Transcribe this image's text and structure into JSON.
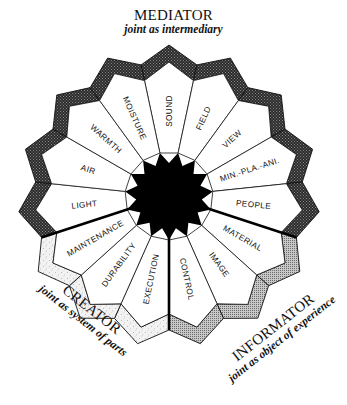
{
  "diagram": {
    "center": [
      169,
      196
    ],
    "segment_count": 15,
    "start_angle_deg": -102,
    "radii": {
      "star_outer": 44,
      "star_inner": 33,
      "band_inner_valley": 118,
      "band_inner_peak": 134,
      "band_outer_valley": 134,
      "band_outer_peak": 151
    },
    "segments": [
      {
        "label": "SOUND",
        "zone": "mediator"
      },
      {
        "label": "FIELD",
        "zone": "mediator"
      },
      {
        "label": "VIEW",
        "zone": "mediator"
      },
      {
        "label": "MIN.-PLA.-ANI.",
        "zone": "mediator"
      },
      {
        "label": "PEOPLE",
        "zone": "mediator"
      },
      {
        "label": "MATERIAL",
        "zone": "informator"
      },
      {
        "label": "IMAGE",
        "zone": "informator"
      },
      {
        "label": "CONTROL",
        "zone": "informator"
      },
      {
        "label": "EXECUTION",
        "zone": "creator"
      },
      {
        "label": "DURABILITY",
        "zone": "creator"
      },
      {
        "label": "MAINTENANCE",
        "zone": "creator"
      },
      {
        "label": "LIGHT",
        "zone": "mediator"
      },
      {
        "label": "AIR",
        "zone": "mediator"
      },
      {
        "label": "WARMTH",
        "zone": "mediator"
      },
      {
        "label": "MOISTURE",
        "zone": "mediator"
      }
    ],
    "thick_boundaries": [
      5,
      8,
      11
    ],
    "zone_colors": {
      "mediator": "#3a3a3a",
      "informator": "#9a9a9a",
      "creator": "#e4e4e4"
    }
  },
  "zones": {
    "mediator": {
      "title": "MEDIATOR",
      "subtitle": "joint as intermediary"
    },
    "creator": {
      "title": "CREATOR",
      "subtitle": "joint as system of parts"
    },
    "informator": {
      "title": "INFORMATOR",
      "subtitle": "joint as object of experience"
    }
  }
}
